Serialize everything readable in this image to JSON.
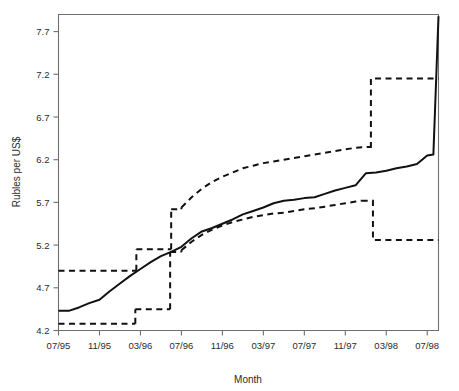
{
  "chart_data": {
    "type": "line",
    "title": "",
    "xlabel": "Month",
    "ylabel": "Rubles per US$",
    "grid": false,
    "legend": "none",
    "xlim": [
      "07/95",
      "08/98"
    ],
    "ylim": [
      4.2,
      7.9
    ],
    "yticks": [
      "4.2",
      "4.7",
      "5.2",
      "5.7",
      "6.2",
      "6.7",
      "7.2",
      "7.7"
    ],
    "ytick_values": [
      4.2,
      4.7,
      5.2,
      5.7,
      6.2,
      6.7,
      7.2,
      7.7
    ],
    "xticks": [
      "07/95",
      "11/95",
      "03/96",
      "07/96",
      "11/96",
      "03/97",
      "07/97",
      "11/97",
      "03/98",
      "07/98"
    ],
    "xtick_months": [
      0,
      4,
      8,
      12,
      16,
      20,
      24,
      28,
      32,
      36
    ],
    "series": [
      {
        "name": "Exchange rate",
        "style": "solid",
        "color": "#111111",
        "x": [
          0,
          1,
          2,
          3,
          4,
          5,
          6,
          7,
          8,
          9,
          10,
          11,
          12,
          13,
          14,
          15,
          16,
          17,
          18,
          19,
          20,
          21,
          22,
          23,
          24,
          25,
          26,
          27,
          28,
          29,
          30,
          31,
          32,
          33,
          34,
          35,
          36,
          36.6,
          37.1
        ],
        "values": [
          4.43,
          4.43,
          4.47,
          4.52,
          4.56,
          4.66,
          4.75,
          4.84,
          4.92,
          5.0,
          5.07,
          5.12,
          5.18,
          5.28,
          5.36,
          5.4,
          5.45,
          5.5,
          5.56,
          5.6,
          5.64,
          5.69,
          5.72,
          5.73,
          5.75,
          5.76,
          5.8,
          5.84,
          5.87,
          5.9,
          6.04,
          6.05,
          6.07,
          6.1,
          6.12,
          6.15,
          6.25,
          6.26,
          7.88
        ]
      },
      {
        "name": "Upper band",
        "style": "dashed",
        "color": "#111111",
        "steps": [
          {
            "from_month": 0,
            "to_month": 7.6,
            "value": 4.9
          },
          {
            "from_month": 7.6,
            "to_month": 11.0,
            "value": 5.15
          },
          {
            "from_month": 11.0,
            "to_month": 12.0,
            "value": 5.62
          },
          {
            "from_month": 12.0,
            "to_month": 30.5,
            "value": null
          },
          {
            "from_month": 30.5,
            "to_month": 37.1,
            "value": 7.15
          }
        ],
        "ramp_x": [
          12,
          13,
          14,
          15,
          16,
          17,
          18,
          19,
          20,
          21,
          22,
          23,
          24,
          25,
          26,
          27,
          28,
          29,
          30.4
        ],
        "ramp_values": [
          5.64,
          5.76,
          5.86,
          5.94,
          6.0,
          6.05,
          6.1,
          6.13,
          6.16,
          6.18,
          6.2,
          6.22,
          6.24,
          6.26,
          6.28,
          6.3,
          6.32,
          6.34,
          6.35
        ]
      },
      {
        "name": "Lower band",
        "style": "dashed",
        "color": "#111111",
        "steps": [
          {
            "from_month": 0,
            "to_month": 7.5,
            "value": 4.28
          },
          {
            "from_month": 7.5,
            "to_month": 10.9,
            "value": 4.45
          },
          {
            "from_month": 10.9,
            "to_month": 12.0,
            "value": 5.12
          },
          {
            "from_month": 30.7,
            "to_month": 37.1,
            "value": 5.26
          }
        ],
        "ramp_x": [
          12,
          13,
          14,
          15,
          16,
          17,
          18,
          19,
          20,
          21,
          22,
          23,
          24,
          25,
          26,
          27,
          28,
          29,
          29.6
        ],
        "ramp_values": [
          5.14,
          5.24,
          5.32,
          5.38,
          5.43,
          5.47,
          5.5,
          5.53,
          5.55,
          5.57,
          5.58,
          5.6,
          5.62,
          5.63,
          5.65,
          5.67,
          5.69,
          5.71,
          5.72
        ]
      }
    ]
  },
  "axis": {
    "ylabel_text": "Rubles per US$",
    "xlabel_text": "Month"
  }
}
